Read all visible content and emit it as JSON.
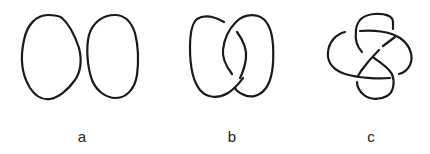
{
  "figure": {
    "panels": [
      {
        "label": "a",
        "description": "two unlinked circles (unlink)"
      },
      {
        "label": "b",
        "description": "Hopf link"
      },
      {
        "label": "c",
        "description": "figure-eight knot"
      }
    ],
    "stroke_color": "#1a1a1a",
    "background": "#ffffff"
  }
}
